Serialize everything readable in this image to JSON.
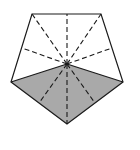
{
  "diagram": {
    "shape": "regular pentagon",
    "colors": {
      "stroke": "#1a1a1a",
      "shade": "#a9a9a9",
      "background": "#ffffff"
    },
    "vertices": [
      [
        32,
        14
      ],
      [
        101,
        14
      ],
      [
        123,
        82
      ],
      [
        67,
        124
      ],
      [
        11,
        82
      ]
    ],
    "center": [
      67,
      64
    ],
    "shaded_region": "two lower triangles (center, left vertex, bottom vertex, right vertex)",
    "solid_lines": "center to left and right vertices",
    "dashed_lines": "center to remaining vertices and edge midpoints"
  }
}
